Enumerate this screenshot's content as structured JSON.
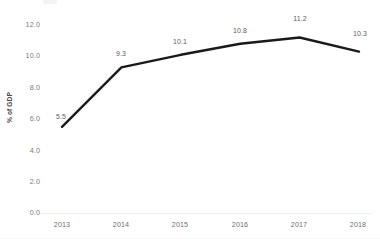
{
  "figure": {
    "background_color": "#ffffff",
    "line_color": "#1a1a1a",
    "tick_text_color": "#7b7b7b",
    "axis_title_color": "#4a4a4a",
    "data_label_color": "#5d5d5d",
    "baseline_color": "#f0f0f2"
  },
  "chart_data": {
    "type": "line",
    "title": "",
    "subtitle": "",
    "xlabel": "",
    "ylabel": "% of GDP",
    "categories": [
      "2013",
      "2014",
      "2015",
      "2016",
      "2017",
      "2018"
    ],
    "values": [
      5.5,
      9.3,
      10.1,
      10.8,
      11.2,
      10.3
    ],
    "data_labels": [
      "5.5",
      "9.3",
      "10.1",
      "10.8",
      "11.2",
      "10.3"
    ],
    "series": [
      {
        "name": "",
        "values": [
          5.5,
          9.3,
          10.1,
          10.8,
          11.2,
          10.3
        ],
        "color": "#1a1a1a",
        "marker": "none",
        "line_width": 2.4
      }
    ],
    "ylim": [
      0.0,
      12.0
    ],
    "ytick_labels": [
      "0.0",
      "2.0",
      "4.0",
      "6.0",
      "8.0",
      "10.0",
      "12.0"
    ],
    "ytick_values": [
      0.0,
      2.0,
      4.0,
      6.0,
      8.0,
      10.0,
      12.0
    ],
    "xtick_labels": [
      "2013",
      "2014",
      "2015",
      "2016",
      "2017",
      "2018"
    ],
    "grid": false,
    "legend": false,
    "legend_position": "none",
    "annotations": []
  }
}
